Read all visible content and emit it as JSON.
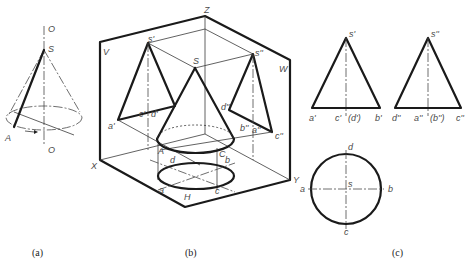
{
  "figure": {
    "subfigures": [
      {
        "id": "a",
        "caption": "(a)",
        "description": "Cone generated by rotating line SA about axis O-O",
        "labels": {
          "axis_top": "O",
          "apex": "S",
          "generatrix_end": "A",
          "axis_bottom": "O"
        }
      },
      {
        "id": "b",
        "caption": "(b)",
        "description": "Cone projected onto three projection planes V, H, W",
        "labels": {
          "axis_z": "Z",
          "axis_x": "X",
          "axis_y": "Y",
          "plane_v": "V",
          "plane_h": "H",
          "plane_w": "W",
          "apex": "S",
          "front_apex": "s'",
          "side_apex": "s''",
          "front_a": "a'",
          "front_c": "c'",
          "front_d": "d'",
          "side_d": "d''",
          "side_b": "b''",
          "side_a": "a''",
          "side_c": "c''",
          "base_A": "A",
          "base_C": "C",
          "top_a": "a",
          "top_b": "b",
          "top_c": "c",
          "top_d": "d"
        }
      },
      {
        "id": "c",
        "caption": "(c)",
        "description": "Three-view drawing of cone",
        "front_view": {
          "apex": "s'",
          "bottom_labels": [
            "a'",
            "c'",
            "(d')",
            "b'"
          ]
        },
        "side_view": {
          "apex": "s''",
          "bottom_labels": [
            "d''",
            "a''",
            "(b'')",
            "c''"
          ]
        },
        "top_view": {
          "labels": {
            "top": "d",
            "left": "a",
            "center": "s",
            "right": "b",
            "bottom": "c"
          }
        }
      }
    ]
  }
}
